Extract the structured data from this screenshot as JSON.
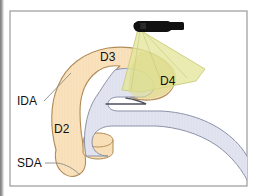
{
  "figure": {
    "kind": "anatomical-line-diagram",
    "background_color": "#ffffff",
    "frame": {
      "border_color": "#9a9a9a",
      "fill_color": "#ffffff"
    }
  },
  "palette": {
    "duodenum_fill": "#f8dfb8",
    "duodenum_stroke": "#b08a55",
    "lumen_fill": "#dfe2ee",
    "lumen_stroke": "#8a8fa6",
    "beam_fill": "#e3e59a",
    "beam_stroke": "#c9cc7a",
    "overlap_fill": "#dcdc8c",
    "probe_fill": "#111111",
    "label_color": "#111111",
    "leader_color": "#8a8a8a"
  },
  "labels": [
    {
      "id": "d3",
      "text": "D3",
      "role": "duodenum-segment",
      "has_leader": false
    },
    {
      "id": "d4",
      "text": "D4",
      "role": "duodenum-segment",
      "has_leader": false
    },
    {
      "id": "d2",
      "text": "D2",
      "role": "duodenum-segment",
      "has_leader": false
    },
    {
      "id": "ida",
      "text": "IDA",
      "role": "artery-inferior-duodenal",
      "has_leader": true
    },
    {
      "id": "sda",
      "text": "SDA",
      "role": "artery-superior-duodenal",
      "has_leader": true
    }
  ],
  "elements": {
    "probe": {
      "name": "ultrasound-probe",
      "visible": true
    },
    "beam": {
      "name": "ultrasound-beam-cone",
      "visible": true
    },
    "duodenum": {
      "name": "duodenum-body",
      "visible": true
    },
    "lumen": {
      "name": "lumen-structure",
      "visible": true
    },
    "papilla": {
      "name": "papilla-stub",
      "visible": true
    }
  }
}
